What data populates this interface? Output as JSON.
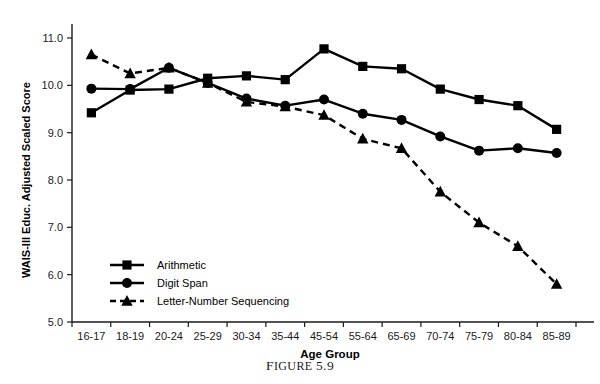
{
  "figure": {
    "caption_prefix": "F",
    "caption_rest": "IGURE",
    "caption_number": "5.9",
    "caption_full": "FIGURE 5.9"
  },
  "chart_data": {
    "type": "line",
    "title": "",
    "xlabel": "Age Group",
    "ylabel": "WAIS-III Educ. Adjusted Scaled Score",
    "categories": [
      "16-17",
      "18-19",
      "20-24",
      "25-29",
      "30-34",
      "35-44",
      "45-54",
      "55-64",
      "65-69",
      "70-74",
      "75-79",
      "80-84",
      "85-89"
    ],
    "ylim": [
      5.0,
      11.0
    ],
    "yticks": [
      "5.0",
      "6.0",
      "7.0",
      "8.0",
      "9.0",
      "10.0",
      "11.0"
    ],
    "ytick_values": [
      5.0,
      6.0,
      7.0,
      8.0,
      9.0,
      10.0,
      11.0
    ],
    "grid": false,
    "legend_position": "lower-left",
    "series": [
      {
        "name": "Arithmetic",
        "marker": "square",
        "linestyle": "solid",
        "color": "#000000",
        "values": [
          9.42,
          9.9,
          9.92,
          10.15,
          10.2,
          10.12,
          10.77,
          10.4,
          10.35,
          9.92,
          9.7,
          9.57,
          9.07
        ]
      },
      {
        "name": "Digit Span",
        "marker": "circle",
        "linestyle": "solid",
        "color": "#000000",
        "values": [
          9.93,
          9.92,
          10.37,
          10.05,
          9.72,
          9.57,
          9.7,
          9.4,
          9.27,
          8.92,
          8.62,
          8.67,
          8.57
        ]
      },
      {
        "name": "Letter-Number Sequencing",
        "marker": "triangle",
        "linestyle": "dashed",
        "color": "#000000",
        "values": [
          10.65,
          10.25,
          10.37,
          10.05,
          9.65,
          9.55,
          9.37,
          8.87,
          8.67,
          7.75,
          7.1,
          6.6,
          5.8
        ]
      }
    ]
  }
}
